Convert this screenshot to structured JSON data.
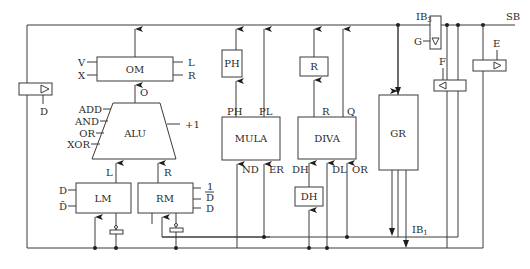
{
  "diagram": {
    "type": "block-diagram",
    "buses": {
      "system_bus": "SB",
      "ib3": {
        "base": "IB",
        "sub": "3"
      },
      "ib1": {
        "base": "IB",
        "sub": "1"
      }
    },
    "blocks": {
      "om": {
        "label": "OM",
        "inputs_left": [
          "V",
          "X"
        ],
        "inputs_right": [
          "L",
          "R"
        ],
        "input_bottom": "O"
      },
      "alu": {
        "label": "ALU",
        "controls_left": [
          "ADD",
          "AND",
          "OR",
          "XOR"
        ],
        "control_right": "+1",
        "inputs_bottom": [
          "L",
          "R"
        ]
      },
      "lm": {
        "label": "LM",
        "controls_left": [
          "D",
          "D̄"
        ]
      },
      "rm": {
        "label": "RM",
        "controls_right": [
          "1",
          "D",
          "D"
        ]
      },
      "ph": {
        "label": "PH"
      },
      "mula": {
        "label": "MULA",
        "outputs_top": [
          "PH",
          "PL"
        ],
        "inputs_bottom": [
          "ND",
          "ER"
        ]
      },
      "r": {
        "label": "R"
      },
      "diva": {
        "label": "DIVA",
        "outputs_top": [
          "R",
          "Q"
        ],
        "inputs_bottom": [
          "DH",
          "DL",
          "OR"
        ]
      },
      "dh": {
        "label": "DH"
      },
      "gr": {
        "label": "GR"
      }
    },
    "buffers": {
      "d_left": {
        "control": "D"
      },
      "ib3_buf": {
        "control": "G"
      },
      "f_buf": {
        "control": "F"
      },
      "e_buf": {
        "control": "E"
      }
    }
  }
}
